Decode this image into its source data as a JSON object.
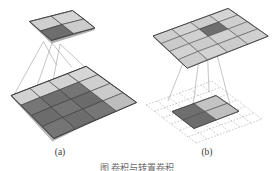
{
  "figure": {
    "background_color": "#ffffff",
    "panels": [
      {
        "id": "a",
        "caption": "(a)",
        "description": "convolution: 4x4 input feature map with 3x3 highlighted receptive field projecting to a 2x2 output feature map with one highlighted cell",
        "top_grid": {
          "name": "output-feature-map-a",
          "rows": 2,
          "cols": 2,
          "highlight_cells": [
            [
              1,
              0
            ]
          ],
          "style": "solid"
        },
        "bottom_grid": {
          "name": "input-feature-map-a",
          "rows": 4,
          "cols": 4,
          "highlight_region": {
            "row_start": 1,
            "row_end": 3,
            "col_start": 0,
            "col_end": 2
          },
          "style": "solid"
        },
        "projection_lines": 4
      },
      {
        "id": "b",
        "caption": "(b)",
        "description": "transposed convolution: 4x4 output feature map with one highlighted cell projecting down to a dashed padded grid containing a solid 2x2 block",
        "top_grid": {
          "name": "output-feature-map-b",
          "rows": 4,
          "cols": 4,
          "highlight_cells": [
            [
              1,
              2
            ]
          ],
          "style": "solid"
        },
        "bottom_grid": {
          "name": "padded-input-feature-map-b",
          "rows": 6,
          "cols": 6,
          "solid_block": {
            "row_start": 2,
            "row_end": 3,
            "col_start": 2,
            "col_end": 3
          },
          "style": "dashed"
        },
        "projection_lines": 4
      }
    ],
    "bottom_caption_partial": "图  卷积与转置卷积",
    "colors": {
      "cell_light": "#cfcfcf",
      "cell_mid": "#bdbdbd",
      "cell_dark": "#6e6e6e",
      "cell_dark_alt": "#7d7d7d",
      "grid_line": "#4a4a4a",
      "dashed_line": "#9a9a9a",
      "projection_line": "#9e9e9e",
      "caption_text": "#3a3a3a"
    }
  }
}
